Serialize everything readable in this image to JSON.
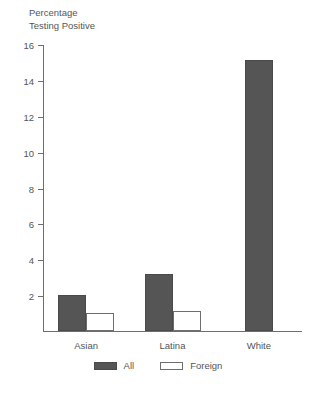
{
  "chart_data": {
    "type": "bar",
    "title": "",
    "ylabel": "Percentage\nTesting Positive",
    "xlabel": "",
    "categories": [
      "Asian",
      "Latina",
      "White"
    ],
    "series": [
      {
        "name": "All",
        "values": [
          2.0,
          3.2,
          15.1
        ],
        "color": "#555555"
      },
      {
        "name": "Foreign",
        "values": [
          1.0,
          1.1,
          null
        ],
        "color": "#ffffff"
      }
    ],
    "ylim": [
      0,
      16
    ],
    "yticks": [
      0,
      2,
      4,
      6,
      8,
      10,
      12,
      14,
      16
    ],
    "ytick_labels": [
      "",
      "2",
      "4",
      "6",
      "8",
      "10",
      "12",
      "14",
      "16"
    ],
    "grid": false,
    "legend_position": "bottom"
  },
  "legend": {
    "items": [
      {
        "label": "All",
        "style": "filled"
      },
      {
        "label": "Foreign",
        "style": "outline"
      }
    ]
  },
  "caption": ""
}
